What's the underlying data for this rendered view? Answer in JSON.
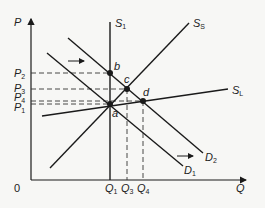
{
  "diagram": {
    "type": "supply-demand-economics",
    "colors": {
      "line": "#1a1a1a",
      "dashed": "#333333",
      "background": "#f7f7f5"
    },
    "axes": {
      "y_label": "P",
      "x_label": "Q",
      "origin_label": "0"
    },
    "curves": {
      "S1": {
        "main": "S",
        "sub": "1"
      },
      "SS": {
        "main": "S",
        "sub": "S"
      },
      "SL": {
        "main": "S",
        "sub": "L"
      },
      "D1": {
        "main": "D",
        "sub": "1"
      },
      "D2": {
        "main": "D",
        "sub": "2"
      }
    },
    "points": {
      "a": "a",
      "b": "b",
      "c": "c",
      "d": "d"
    },
    "price_levels": [
      {
        "main": "P",
        "sub": "2"
      },
      {
        "main": "P",
        "sub": "3"
      },
      {
        "main": "P",
        "sub": "4"
      },
      {
        "main": "P",
        "sub": "1"
      }
    ],
    "quantity_levels": [
      {
        "main": "Q",
        "sub": "1"
      },
      {
        "main": "Q",
        "sub": "3"
      },
      {
        "main": "Q",
        "sub": "4"
      }
    ]
  }
}
